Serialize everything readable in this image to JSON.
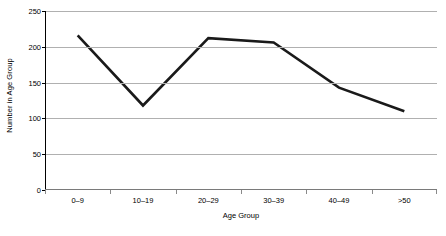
{
  "chart_data": {
    "type": "line",
    "title": "",
    "subtitle": "",
    "xlabel": "Age Group",
    "ylabel": "Number in Age Group",
    "categories": [
      "0–9",
      "10–19",
      "20–29",
      "30–39",
      "40–49",
      ">50"
    ],
    "values": [
      216,
      118,
      212,
      206,
      143,
      110
    ],
    "series": [
      {
        "name": "Number in Age Group",
        "values": [
          216,
          118,
          212,
          206,
          143,
          110
        ]
      }
    ],
    "ylim": [
      0,
      250
    ],
    "ytick_labels": [
      "0",
      "50",
      "100",
      "150",
      "200",
      "250"
    ],
    "ytick_values": [
      0,
      50,
      100,
      150,
      200,
      250
    ],
    "grid": "horizontal",
    "legend": "none",
    "annotations": [],
    "colors": {
      "line": "#1a1a1a",
      "gridline": "#b0b0b0",
      "axis": "#000000",
      "background": "#ffffff"
    },
    "line_width_px": 2.6
  }
}
